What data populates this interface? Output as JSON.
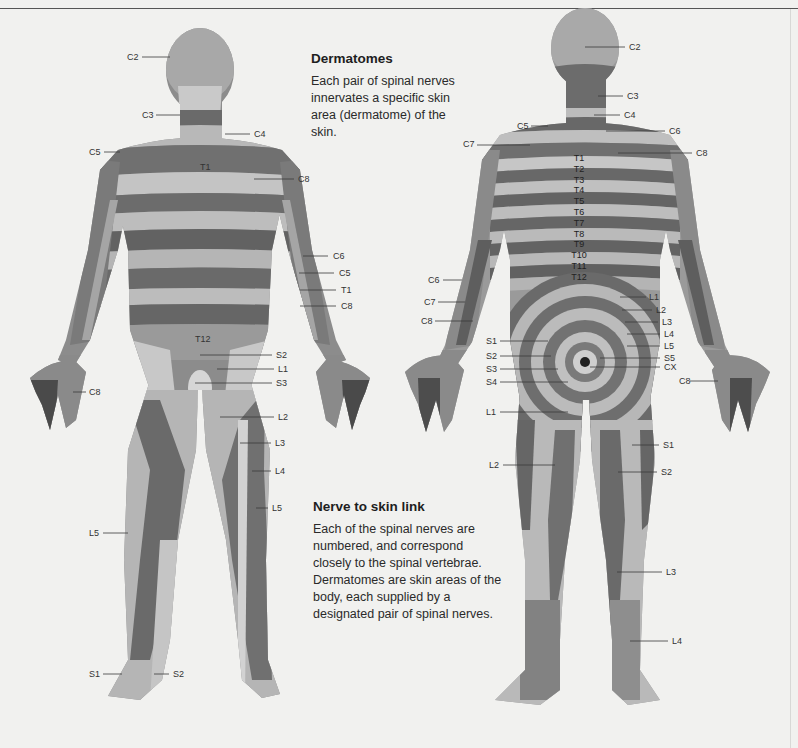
{
  "section1": {
    "title": "Dermatomes",
    "body": "Each pair of spinal nerves innervates a specific skin area (dermatome) of the skin."
  },
  "section2": {
    "title": "Nerve to skin link",
    "body": "Each of the spinal nerves are numbered, and correspond closely to the spinal vertebrae. Dermatomes are skin areas of the body, each supplied by a designated pair of spinal nerves."
  },
  "colors": {
    "background": "#f1f1ef",
    "band_dark": "#6e6e6e",
    "band_mid": "#9a9a9a",
    "band_light": "#cfcfcf",
    "rule": "#555555"
  },
  "front_labels": [
    {
      "text": "C2",
      "x": 127,
      "y": 52,
      "lx1": 142,
      "lx2": 170,
      "ly": 57
    },
    {
      "text": "C3",
      "x": 142,
      "y": 110,
      "lx1": 156,
      "lx2": 180,
      "ly": 115
    },
    {
      "text": "C4",
      "x": 254,
      "y": 129,
      "lx1": 225,
      "lx2": 250,
      "ly": 134
    },
    {
      "text": "C5",
      "x": 89,
      "y": 147,
      "lx1": 104,
      "lx2": 120,
      "ly": 152
    },
    {
      "text": "C8",
      "x": 298,
      "y": 174,
      "lx1": 254,
      "lx2": 294,
      "ly": 179
    },
    {
      "text": "C6",
      "x": 333,
      "y": 251,
      "lx1": 303,
      "lx2": 328,
      "ly": 256
    },
    {
      "text": "C5",
      "x": 339,
      "y": 268,
      "lx1": 299,
      "lx2": 334,
      "ly": 273
    },
    {
      "text": "T1",
      "x": 341,
      "y": 285,
      "lx1": 300,
      "lx2": 336,
      "ly": 290
    },
    {
      "text": "C8",
      "x": 341,
      "y": 301,
      "lx1": 300,
      "lx2": 336,
      "ly": 306
    },
    {
      "text": "S2",
      "x": 276,
      "y": 350,
      "lx1": 200,
      "lx2": 272,
      "ly": 355
    },
    {
      "text": "L1",
      "x": 278,
      "y": 364,
      "lx1": 217,
      "lx2": 274,
      "ly": 369
    },
    {
      "text": "S3",
      "x": 276,
      "y": 378,
      "lx1": 195,
      "lx2": 272,
      "ly": 383
    },
    {
      "text": "C8",
      "x": 89,
      "y": 387,
      "lx1": 73,
      "lx2": 86,
      "ly": 392
    },
    {
      "text": "L2",
      "x": 278,
      "y": 412,
      "lx1": 220,
      "lx2": 274,
      "ly": 417
    },
    {
      "text": "L3",
      "x": 275,
      "y": 438,
      "lx1": 240,
      "lx2": 271,
      "ly": 443
    },
    {
      "text": "L4",
      "x": 275,
      "y": 466,
      "lx1": 252,
      "lx2": 271,
      "ly": 471
    },
    {
      "text": "L5",
      "x": 272,
      "y": 503,
      "lx1": 256,
      "lx2": 268,
      "ly": 508
    },
    {
      "text": "L5",
      "x": 89,
      "y": 528,
      "lx1": 103,
      "lx2": 128,
      "ly": 533
    },
    {
      "text": "S1",
      "x": 89,
      "y": 669,
      "lx1": 103,
      "lx2": 122,
      "ly": 674
    },
    {
      "text": "S2",
      "x": 173,
      "y": 669,
      "lx1": 154,
      "lx2": 169,
      "ly": 674
    }
  ],
  "front_inline_labels": [
    {
      "text": "T1",
      "x": 200,
      "y": 162
    },
    {
      "text": "T12",
      "x": 195,
      "y": 334
    }
  ],
  "back_labels": [
    {
      "text": "C2",
      "x": 629,
      "y": 42,
      "lx1": 585,
      "lx2": 625,
      "ly": 47
    },
    {
      "text": "C3",
      "x": 627,
      "y": 91,
      "lx1": 598,
      "lx2": 623,
      "ly": 96
    },
    {
      "text": "C4",
      "x": 624,
      "y": 110,
      "lx1": 594,
      "lx2": 620,
      "ly": 115
    },
    {
      "text": "C5",
      "x": 517,
      "y": 121,
      "lx1": 531,
      "lx2": 548,
      "ly": 126
    },
    {
      "text": "C6",
      "x": 669,
      "y": 126,
      "lx1": 606,
      "lx2": 665,
      "ly": 131
    },
    {
      "text": "C7",
      "x": 463,
      "y": 139,
      "lx1": 477,
      "lx2": 530,
      "ly": 145
    },
    {
      "text": "C8",
      "x": 696,
      "y": 148,
      "lx1": 618,
      "lx2": 692,
      "ly": 153
    },
    {
      "text": "C6",
      "x": 428,
      "y": 275,
      "lx1": 443,
      "lx2": 462,
      "ly": 280
    },
    {
      "text": "L1",
      "x": 649,
      "y": 292,
      "lx1": 620,
      "lx2": 646,
      "ly": 297
    },
    {
      "text": "C7",
      "x": 424,
      "y": 297,
      "lx1": 438,
      "lx2": 465,
      "ly": 302
    },
    {
      "text": "L2",
      "x": 656,
      "y": 305,
      "lx1": 622,
      "lx2": 652,
      "ly": 310
    },
    {
      "text": "L3",
      "x": 662,
      "y": 317,
      "lx1": 625,
      "lx2": 658,
      "ly": 322
    },
    {
      "text": "C8",
      "x": 421,
      "y": 316,
      "lx1": 435,
      "lx2": 473,
      "ly": 321
    },
    {
      "text": "L4",
      "x": 664,
      "y": 329,
      "lx1": 627,
      "lx2": 660,
      "ly": 334
    },
    {
      "text": "S1",
      "x": 486,
      "y": 336,
      "lx1": 500,
      "lx2": 548,
      "ly": 341
    },
    {
      "text": "L5",
      "x": 664,
      "y": 341,
      "lx1": 627,
      "lx2": 660,
      "ly": 346
    },
    {
      "text": "S2",
      "x": 486,
      "y": 351,
      "lx1": 500,
      "lx2": 551,
      "ly": 356
    },
    {
      "text": "S5",
      "x": 664,
      "y": 353,
      "lx1": 600,
      "lx2": 660,
      "ly": 358
    },
    {
      "text": "S3",
      "x": 486,
      "y": 364,
      "lx1": 500,
      "lx2": 558,
      "ly": 369
    },
    {
      "text": "CX",
      "x": 664,
      "y": 362,
      "lx1": 590,
      "lx2": 660,
      "ly": 367
    },
    {
      "text": "S4",
      "x": 486,
      "y": 377,
      "lx1": 500,
      "lx2": 568,
      "ly": 382
    },
    {
      "text": "C8",
      "x": 679,
      "y": 376,
      "lx1": 690,
      "lx2": 718,
      "ly": 381
    },
    {
      "text": "L1",
      "x": 486,
      "y": 407,
      "lx1": 500,
      "lx2": 568,
      "ly": 412
    },
    {
      "text": "S1",
      "x": 663,
      "y": 440,
      "lx1": 632,
      "lx2": 659,
      "ly": 445
    },
    {
      "text": "L2",
      "x": 489,
      "y": 460,
      "lx1": 503,
      "lx2": 555,
      "ly": 465
    },
    {
      "text": "S2",
      "x": 661,
      "y": 467,
      "lx1": 618,
      "lx2": 657,
      "ly": 472
    },
    {
      "text": "L3",
      "x": 666,
      "y": 567,
      "lx1": 617,
      "lx2": 662,
      "ly": 572
    },
    {
      "text": "L4",
      "x": 672,
      "y": 636,
      "lx1": 630,
      "lx2": 668,
      "ly": 641
    }
  ],
  "back_spine_labels": [
    "T1",
    "T2",
    "T3",
    "T4",
    "T5",
    "T6",
    "T7",
    "T8",
    "T9",
    "T10",
    "T11",
    "T12"
  ]
}
